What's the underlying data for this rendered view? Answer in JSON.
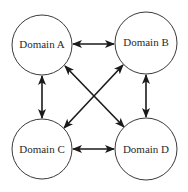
{
  "diagram": {
    "type": "relationship-graph",
    "nodes": [
      {
        "id": "A",
        "label": "Domain A",
        "cx": 42,
        "cy": 45,
        "r": 30
      },
      {
        "id": "B",
        "label": "Domain B",
        "cx": 146,
        "cy": 43,
        "r": 31
      },
      {
        "id": "C",
        "label": "Domain C",
        "cx": 42,
        "cy": 149,
        "r": 30
      },
      {
        "id": "D",
        "label": "Domain D",
        "cx": 146,
        "cy": 149,
        "r": 31
      }
    ],
    "edges": [
      {
        "from": "A",
        "to": "B",
        "direction": "bidirectional"
      },
      {
        "from": "A",
        "to": "C",
        "direction": "bidirectional"
      },
      {
        "from": "B",
        "to": "D",
        "direction": "bidirectional"
      },
      {
        "from": "C",
        "to": "D",
        "direction": "bidirectional"
      },
      {
        "from": "A",
        "to": "D",
        "direction": "bidirectional"
      },
      {
        "from": "B",
        "to": "C",
        "direction": "bidirectional"
      }
    ],
    "colors": {
      "stroke": "#3a3a3a",
      "arrow": "#1a1a1a",
      "text": "#2a2a2a",
      "background": "#ffffff"
    }
  }
}
